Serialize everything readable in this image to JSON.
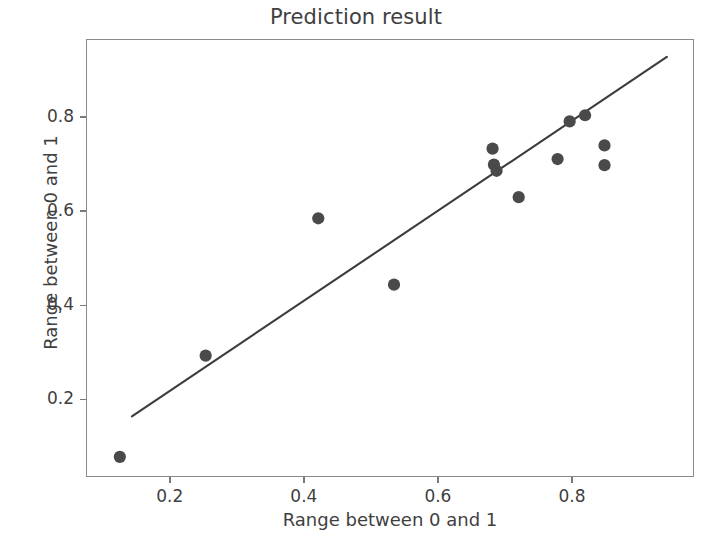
{
  "chart_data": {
    "type": "scatter",
    "title": "Prediction result",
    "xlabel": "Range between 0 and 1",
    "ylabel": "Range between 0 and 1",
    "xlim": [
      0.075,
      0.982
    ],
    "ylim": [
      0.035,
      0.966
    ],
    "xticks": [
      0.2,
      0.4,
      0.6,
      0.8
    ],
    "yticks": [
      0.2,
      0.4,
      0.6,
      0.8
    ],
    "xtick_labels": [
      "0.2",
      "0.4",
      "0.6",
      "0.8"
    ],
    "ytick_labels": [
      "0.2",
      "0.4",
      "0.6",
      "0.8"
    ],
    "grid": false,
    "legend": null,
    "marker_color": "#4a4a4a",
    "marker_size": 9,
    "points": [
      {
        "x": 0.124,
        "y": 0.08
      },
      {
        "x": 0.252,
        "y": 0.295
      },
      {
        "x": 0.42,
        "y": 0.587
      },
      {
        "x": 0.533,
        "y": 0.446
      },
      {
        "x": 0.68,
        "y": 0.735
      },
      {
        "x": 0.682,
        "y": 0.701
      },
      {
        "x": 0.686,
        "y": 0.688
      },
      {
        "x": 0.719,
        "y": 0.632
      },
      {
        "x": 0.777,
        "y": 0.713
      },
      {
        "x": 0.795,
        "y": 0.793
      },
      {
        "x": 0.818,
        "y": 0.806
      },
      {
        "x": 0.847,
        "y": 0.742
      },
      {
        "x": 0.847,
        "y": 0.7
      }
    ],
    "series": [
      {
        "name": "predictions",
        "type": "scatter",
        "x": [
          0.124,
          0.252,
          0.42,
          0.533,
          0.68,
          0.682,
          0.686,
          0.719,
          0.777,
          0.795,
          0.818,
          0.847,
          0.847
        ],
        "y": [
          0.08,
          0.295,
          0.587,
          0.446,
          0.735,
          0.701,
          0.688,
          0.632,
          0.713,
          0.793,
          0.806,
          0.742,
          0.7
        ]
      },
      {
        "name": "reference-line",
        "type": "line",
        "color": "#3c3c3c",
        "x": [
          0.142,
          0.94
        ],
        "y": [
          0.166,
          0.93
        ]
      }
    ]
  }
}
